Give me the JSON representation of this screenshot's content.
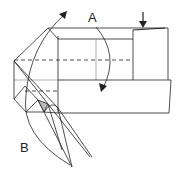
{
  "diagram": {
    "type": "origami-fold-step",
    "labels": {
      "a": "A",
      "b": "B"
    },
    "arrows": [
      {
        "name": "fold-arrow-a",
        "direction": "curved-down",
        "label": "A"
      },
      {
        "name": "fold-arrow-b",
        "direction": "curved-up",
        "label": "B"
      },
      {
        "name": "push-arrow",
        "direction": "down"
      }
    ],
    "colors": {
      "line": "#222222",
      "fill": "#ffffff",
      "shade": "#bbbbbb"
    }
  }
}
